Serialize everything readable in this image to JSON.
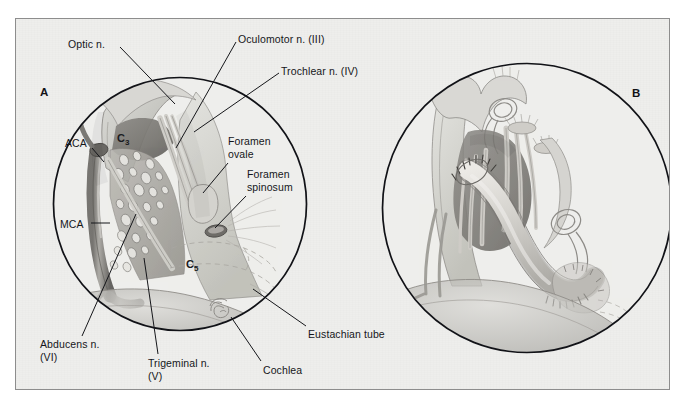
{
  "figure": {
    "background_color": "#eeeeec",
    "frame_border_color": "#8d8d8d",
    "ink_color": "#15161a"
  },
  "panels": [
    {
      "id": "A",
      "letter": "A",
      "letter_x": 40,
      "letter_y": 86,
      "circle": {
        "cx": 180,
        "cy": 204,
        "r": 127
      },
      "inner_labels": [
        {
          "name": "c3-segment",
          "text": "C",
          "sub": "3",
          "x": 117,
          "y": 132
        },
        {
          "name": "c5-segment",
          "text": "C",
          "sub": "5",
          "x": 186,
          "y": 258
        }
      ]
    },
    {
      "id": "B",
      "letter": "B",
      "letter_x": 632,
      "letter_y": 87,
      "circle": {
        "cx": 527,
        "cy": 208,
        "r": 145
      },
      "inner_labels": []
    }
  ],
  "labels": [
    {
      "name": "optic-nerve",
      "lines": [
        "Optic n."
      ],
      "x": 68,
      "y": 38,
      "align": "left",
      "leader": [
        [
          120,
          47
        ],
        [
          175,
          104
        ]
      ]
    },
    {
      "name": "oculomotor-nerve",
      "lines": [
        "Oculomotor n. (III)"
      ],
      "x": 238,
      "y": 33,
      "align": "left",
      "leader": [
        [
          236,
          42
        ],
        [
          176,
          148
        ]
      ]
    },
    {
      "name": "trochlear-nerve",
      "lines": [
        "Trochlear n. (IV)"
      ],
      "x": 281,
      "y": 65,
      "align": "left",
      "leader": [
        [
          279,
          73
        ],
        [
          194,
          132
        ]
      ]
    },
    {
      "name": "foramen-ovale",
      "lines": [
        "Foramen",
        "ovale"
      ],
      "x": 228,
      "y": 135,
      "align": "left",
      "leader": [
        [
          228,
          163
        ],
        [
          203,
          193
        ]
      ]
    },
    {
      "name": "foramen-spinosum",
      "lines": [
        "Foramen",
        "spinosum"
      ],
      "x": 247,
      "y": 168,
      "align": "left",
      "leader": [
        [
          246,
          196
        ],
        [
          215,
          228
        ]
      ]
    },
    {
      "name": "aca-artery",
      "lines": [
        "ACA"
      ],
      "x": 65,
      "y": 137,
      "align": "left",
      "leader": [
        [
          92,
          148
        ],
        [
          104,
          162
        ]
      ]
    },
    {
      "name": "mca-artery",
      "lines": [
        "MCA"
      ],
      "x": 60,
      "y": 218,
      "align": "left",
      "leader": [
        [
          91,
          223
        ],
        [
          110,
          223
        ]
      ]
    },
    {
      "name": "abducens-nerve",
      "lines": [
        "Abducens n.",
        "(VI)"
      ],
      "x": 40,
      "y": 338,
      "align": "left",
      "leader": [
        [
          82,
          336
        ],
        [
          136,
          214
        ]
      ]
    },
    {
      "name": "trigeminal-nerve",
      "lines": [
        "Trigeminal n.",
        "(V)"
      ],
      "x": 148,
      "y": 357,
      "align": "left",
      "leader": [
        [
          158,
          354
        ],
        [
          144,
          258
        ]
      ]
    },
    {
      "name": "cochlea",
      "lines": [
        "Cochlea"
      ],
      "x": 263,
      "y": 364,
      "align": "left",
      "leader": [
        [
          261,
          361
        ],
        [
          231,
          317
        ]
      ]
    },
    {
      "name": "eustachian-tube",
      "lines": [
        "Eustachian tube"
      ],
      "x": 308,
      "y": 328,
      "align": "left",
      "leader": [
        [
          306,
          326
        ],
        [
          253,
          289
        ]
      ]
    }
  ]
}
